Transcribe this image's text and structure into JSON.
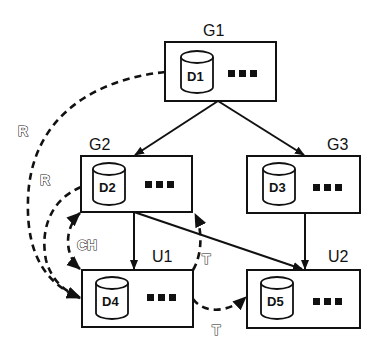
{
  "nodes": [
    {
      "id": "G1",
      "label": "G1",
      "db": "D1",
      "ellipsis": "■■■"
    },
    {
      "id": "G2",
      "label": "G2",
      "db": "D2",
      "ellipsis": "■■■"
    },
    {
      "id": "G3",
      "label": "G3",
      "db": "D3",
      "ellipsis": "■■■"
    },
    {
      "id": "U1",
      "label": "U1",
      "db": "D4",
      "ellipsis": "■■■"
    },
    {
      "id": "U2",
      "label": "U2",
      "db": "D5",
      "ellipsis": "■■■"
    }
  ],
  "edges": [
    {
      "from": "G1",
      "to": "G2",
      "style": "solid"
    },
    {
      "from": "G1",
      "to": "G3",
      "style": "solid"
    },
    {
      "from": "G2",
      "to": "U1",
      "style": "solid"
    },
    {
      "from": "G2",
      "to": "U2",
      "style": "solid"
    },
    {
      "from": "G3",
      "to": "U2",
      "style": "solid"
    },
    {
      "from": "G1",
      "to": "U1",
      "style": "dashed",
      "label": "R"
    },
    {
      "from": "G2",
      "to": "U1",
      "style": "dashed",
      "label": "R"
    },
    {
      "from": "G2",
      "to": "U1",
      "style": "dashed-bidirectional",
      "label": "CH"
    },
    {
      "from": "U1",
      "to": "G2",
      "style": "dashed",
      "label": "T"
    },
    {
      "from": "U1",
      "to": "U2",
      "style": "dashed",
      "label": "T"
    }
  ],
  "edge_labels": {
    "r_outer": "R",
    "r_inner": "R",
    "ch": "CH",
    "t_upper": "T",
    "t_lower": "T"
  }
}
